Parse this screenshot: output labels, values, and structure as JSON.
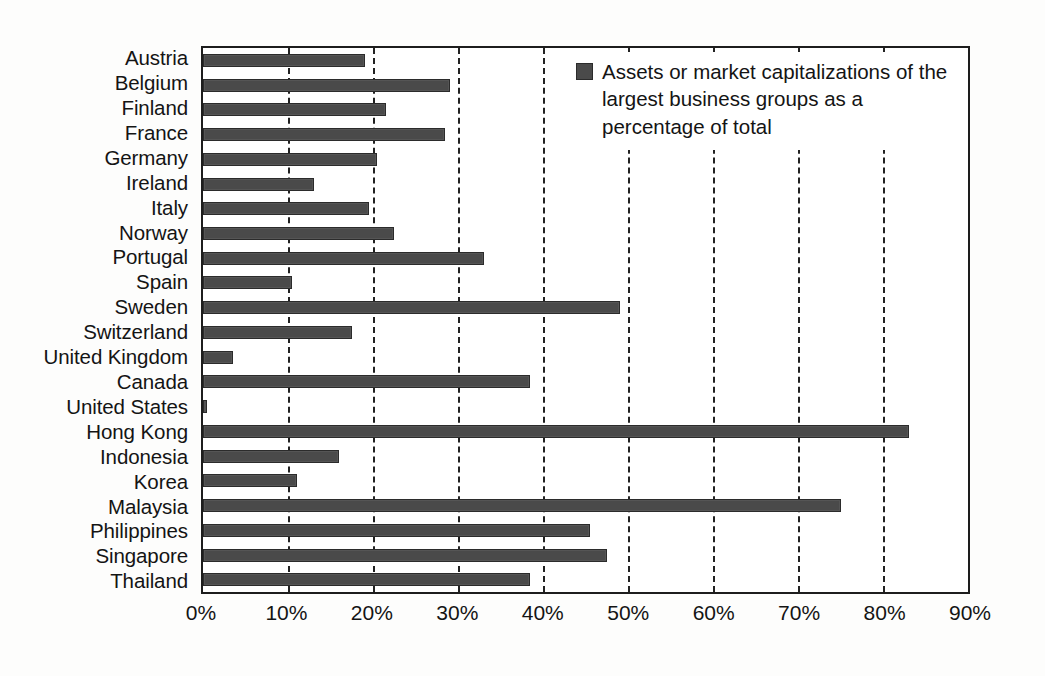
{
  "chart_data": {
    "type": "bar",
    "orientation": "horizontal",
    "title": "",
    "xlabel": "",
    "ylabel": "",
    "xlim": [
      0,
      90
    ],
    "xticks": [
      "0%",
      "10%",
      "20%",
      "30%",
      "40%",
      "50%",
      "60%",
      "70%",
      "80%",
      "90%"
    ],
    "xtick_values": [
      0,
      10,
      20,
      30,
      40,
      50,
      60,
      70,
      80,
      90
    ],
    "grid": "vertical-dashed",
    "legend_position": "top-right",
    "legend": [
      "Assets or market capitalizations of the largest business groups as a percentage of total"
    ],
    "categories": [
      "Austria",
      "Belgium",
      "Finland",
      "France",
      "Germany",
      "Ireland",
      "Italy",
      "Norway",
      "Portugal",
      "Spain",
      "Sweden",
      "Switzerland",
      "United Kingdom",
      "Canada",
      "United States",
      "Hong Kong",
      "Indonesia",
      "Korea",
      "Malaysia",
      "Philippines",
      "Singapore",
      "Thailand"
    ],
    "values": [
      19.0,
      29.0,
      21.5,
      28.5,
      20.5,
      13.0,
      19.5,
      22.5,
      33.0,
      10.5,
      49.0,
      17.5,
      3.5,
      38.5,
      0.5,
      83.0,
      16.0,
      11.0,
      75.0,
      45.5,
      47.5,
      38.5
    ],
    "series": [
      {
        "name": "Assets or market capitalizations of the largest business groups as a percentage of total",
        "color": "#4a4a4a",
        "values": [
          19.0,
          29.0,
          21.5,
          28.5,
          20.5,
          13.0,
          19.5,
          22.5,
          33.0,
          10.5,
          49.0,
          17.5,
          3.5,
          38.5,
          0.5,
          83.0,
          16.0,
          11.0,
          75.0,
          45.5,
          47.5,
          38.5
        ]
      }
    ]
  },
  "legend": {
    "swatch_color": "#4a4a4a",
    "label": "Assets or market capitalizations of the largest business groups as a percentage of total"
  },
  "axis": {
    "bar_color": "#4a4a4a",
    "gridline_color": "#222222",
    "frame_color": "#1d1d1d"
  }
}
